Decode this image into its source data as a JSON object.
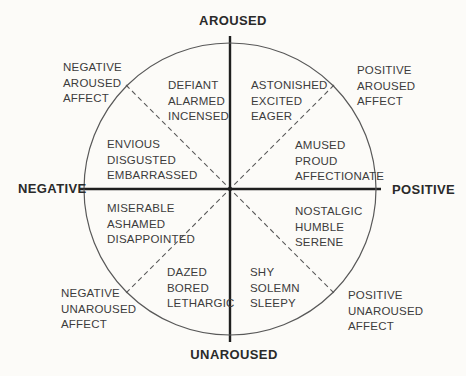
{
  "diagram": {
    "axis_labels": {
      "top": "AROUSED",
      "right": "POSITIVE",
      "bottom": "UNAROUSED",
      "left": "NEGATIVE"
    },
    "outer_labels": {
      "top_left": "NEGATIVE\nAROUSED\nAFFECT",
      "top_right": "POSITIVE\nAROUSED\nAFFECT",
      "bottom_left": "NEGATIVE\nUNAROUSED\nAFFECT",
      "bottom_right": "POSITIVE\nUNAROUSED\nAFFECT"
    },
    "octant_labels": {
      "upper_left": "DEFIANT\nALARMED\nINCENSED",
      "upper_right": "ASTONISHED\nEXCITED\nEAGER",
      "left_upper": "ENVIOUS\nDISGUSTED\nEMBARRASSED",
      "right_upper": "AMUSED\nPROUD\nAFFECTIONATE",
      "left_lower": "MISERABLE\nASHAMED\nDISAPPOINTED",
      "right_lower": "NOSTALGIC\nHUMBLE\nSERENE",
      "lower_left": "DAZED\nBORED\nLETHARGIC",
      "lower_right": "SHY\nSOLEMN\nSLEEPY"
    },
    "colors": {
      "background": "#fcfbf8",
      "circle_stroke": "#585858",
      "axis_stroke": "#1f1f1f",
      "dashed_stroke": "#5a5a5a",
      "text": "#3c3c3c"
    }
  }
}
